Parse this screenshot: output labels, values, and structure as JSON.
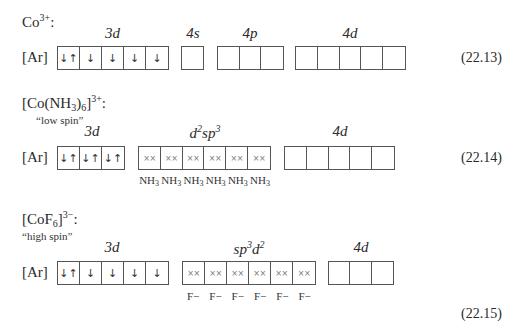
{
  "sections": [
    {
      "title": {
        "base": "Co",
        "sub": "",
        "sup": "3+",
        "suffix": ":"
      },
      "note": "",
      "core": "[Ar]",
      "groups": [
        {
          "label": "3d",
          "label_sup": "",
          "label_tail": "",
          "boxes": [
            "↓↑",
            "↓",
            "↓",
            "↓",
            "↓"
          ],
          "type": "electron"
        },
        {
          "label": "4s",
          "label_sup": "",
          "label_tail": "",
          "boxes": [
            ""
          ],
          "type": "empty"
        },
        {
          "label": "4p",
          "label_sup": "",
          "label_tail": "",
          "boxes": [
            "",
            "",
            ""
          ],
          "type": "empty"
        },
        {
          "label": "4d",
          "label_sup": "",
          "label_tail": "",
          "boxes": [
            "",
            "",
            "",
            "",
            ""
          ],
          "type": "empty"
        }
      ],
      "equation": "(22.13)"
    },
    {
      "title": {
        "base": "[Co(NH",
        "sub": "3",
        "mid": ")",
        "sub2": "6",
        "tail": "]",
        "sup": "3+",
        "suffix": ":"
      },
      "note": "“low spin”",
      "core": "[Ar]",
      "groups": [
        {
          "label": "3d",
          "boxes": [
            "↓↑",
            "↓↑",
            "↓↑"
          ],
          "type": "electron"
        },
        {
          "label": "d2sp3",
          "display": {
            "a": "d",
            "a_sup": "2",
            "b": "sp",
            "b_sup": "3"
          },
          "boxes": [
            "××",
            "××",
            "××",
            "××",
            "××",
            "××"
          ],
          "type": "ligand",
          "ligands": [
            "NH3",
            "NH3",
            "NH3",
            "NH3",
            "NH3",
            "NH3"
          ]
        },
        {
          "label": "4d",
          "boxes": [
            "",
            "",
            "",
            "",
            ""
          ],
          "type": "empty"
        }
      ],
      "equation": "(22.14)"
    },
    {
      "title": {
        "base": "[CoF",
        "sub": "6",
        "tail": "]",
        "sup": "3−",
        "suffix": ":"
      },
      "note": "“high spin”",
      "core": "[Ar]",
      "groups": [
        {
          "label": "3d",
          "boxes": [
            "↓↑",
            "↓",
            "↓",
            "↓",
            "↓"
          ],
          "type": "electron"
        },
        {
          "label": "sp3d2",
          "display": {
            "a": "sp",
            "a_sup": "3",
            "b": "d",
            "b_sup": "2"
          },
          "boxes": [
            "××",
            "××",
            "××",
            "××",
            "××",
            "××"
          ],
          "type": "ligand",
          "ligands": [
            "F−",
            "F−",
            "F−",
            "F−",
            "F−",
            "F−"
          ]
        },
        {
          "label": "4d",
          "boxes": [
            "",
            "",
            ""
          ],
          "type": "empty"
        }
      ],
      "equation": "(22.15)"
    }
  ]
}
